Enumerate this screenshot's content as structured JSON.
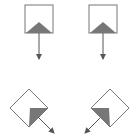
{
  "diagram": {
    "colors": {
      "outline": "#707070",
      "fill_triangle": "#707070",
      "arrow": "#555555",
      "background": "#ffffff"
    },
    "glyphs": [
      {
        "id": "top-left",
        "orientation": "upright",
        "arrow_direction": "down"
      },
      {
        "id": "top-right",
        "orientation": "upright",
        "arrow_direction": "down"
      },
      {
        "id": "bottom-left",
        "orientation": "rotated-45",
        "arrow_direction": "down-right"
      },
      {
        "id": "bottom-right",
        "orientation": "rotated-45",
        "arrow_direction": "down-left"
      }
    ]
  }
}
